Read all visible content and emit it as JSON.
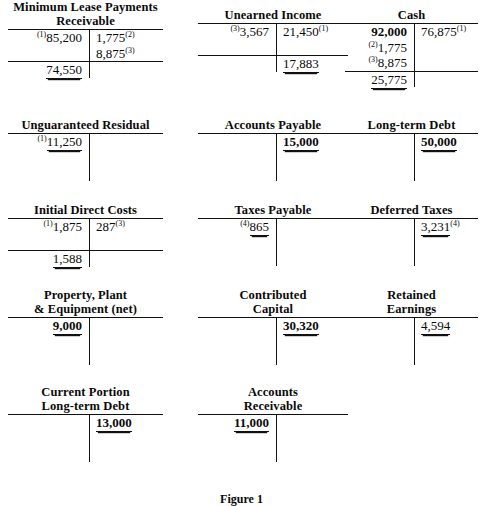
{
  "figure": {
    "caption": "Figure 1"
  },
  "layout": {
    "columns": [
      {
        "left": 8,
        "width": 155
      },
      {
        "left": 198,
        "width": 150
      },
      {
        "left": 345,
        "width": 133
      }
    ],
    "stem_offset": 0.52
  },
  "accounts": [
    {
      "id": "minimum-lease-payments-receivable",
      "name": "Minimum Lease Payments\nReceivable",
      "col": 0,
      "top": 0,
      "title_lines": 2,
      "rows": [
        {
          "debit": {
            "sup_left": "(1)",
            "amount": "85,200"
          },
          "credit": {
            "amount": "1,775",
            "sup_right": "(2)"
          }
        },
        {
          "debit": null,
          "credit": {
            "amount": "8,875",
            "sup_right": "(3)"
          }
        }
      ],
      "footing": true,
      "balance": {
        "side": "debit",
        "amount": "74,550",
        "rule": "double"
      }
    },
    {
      "id": "unearned-income",
      "name": "Unearned Income",
      "col": 1,
      "top": 8,
      "title_lines": 1,
      "rows": [
        {
          "debit": {
            "sup_left": "(3)",
            "amount": "3,567"
          },
          "credit": {
            "amount": "21,450",
            "sup_right": "(1)"
          }
        },
        {
          "debit": null,
          "credit": null
        }
      ],
      "footing": true,
      "balance": {
        "side": "credit",
        "amount": "17,883",
        "rule": "double"
      }
    },
    {
      "id": "cash",
      "name": "Cash",
      "col": 2,
      "top": 8,
      "title_lines": 1,
      "rows": [
        {
          "debit": {
            "amount": "92,000",
            "bold": true
          },
          "credit": {
            "amount": "76,875",
            "sup_right": "(1)"
          }
        },
        {
          "debit": {
            "sup_left": "(2)",
            "amount": "1,775"
          },
          "credit": null
        },
        {
          "debit": {
            "sup_left": "(3)",
            "amount": "8,875"
          },
          "credit": null
        }
      ],
      "footing": true,
      "balance": {
        "side": "debit",
        "amount": "25,775",
        "rule": "double"
      }
    },
    {
      "id": "unguaranteed-residual",
      "name": "Unguaranteed Residual",
      "col": 0,
      "top": 118,
      "title_lines": 1,
      "rows": [
        {
          "debit": {
            "sup_left": "(1)",
            "amount": "11,250",
            "rule": "double"
          },
          "credit": null
        },
        {
          "debit": null,
          "credit": null
        },
        {
          "debit": null,
          "credit": null
        }
      ],
      "footing": false,
      "balance": null
    },
    {
      "id": "accounts-payable",
      "name": "Accounts Payable",
      "col": 1,
      "top": 118,
      "title_lines": 1,
      "rows": [
        {
          "debit": null,
          "credit": {
            "amount": "15,000",
            "bold": true,
            "rule": "double"
          }
        },
        {
          "debit": null,
          "credit": null
        },
        {
          "debit": null,
          "credit": null
        }
      ],
      "footing": false,
      "balance": null
    },
    {
      "id": "long-term-debt",
      "name": "Long-term Debt",
      "col": 2,
      "top": 118,
      "title_lines": 1,
      "rows": [
        {
          "debit": null,
          "credit": {
            "amount": "50,000",
            "bold": true,
            "rule": "double"
          }
        },
        {
          "debit": null,
          "credit": null
        },
        {
          "debit": null,
          "credit": null
        }
      ],
      "footing": false,
      "balance": null
    },
    {
      "id": "initial-direct-costs",
      "name": "Initial Direct Costs",
      "col": 0,
      "top": 203,
      "title_lines": 1,
      "rows": [
        {
          "debit": {
            "sup_left": "(1)",
            "amount": "1,875"
          },
          "credit": {
            "amount": "287",
            "sup_right": "(3)"
          }
        },
        {
          "debit": null,
          "credit": null
        }
      ],
      "footing": true,
      "balance": {
        "side": "debit",
        "amount": "1,588",
        "rule": "double"
      }
    },
    {
      "id": "taxes-payable",
      "name": "Taxes Payable",
      "col": 1,
      "top": 203,
      "title_lines": 1,
      "rows": [
        {
          "debit": {
            "sup_left": "(4)",
            "amount": "865",
            "rule": "double"
          },
          "credit": null
        },
        {
          "debit": null,
          "credit": null
        },
        {
          "debit": null,
          "credit": null
        }
      ],
      "footing": false,
      "balance": null
    },
    {
      "id": "deferred-taxes",
      "name": "Deferred Taxes",
      "col": 2,
      "top": 203,
      "title_lines": 1,
      "rows": [
        {
          "debit": null,
          "credit": {
            "amount": "3,231",
            "sup_right": "(4)",
            "rule": "double"
          }
        },
        {
          "debit": null,
          "credit": null
        },
        {
          "debit": null,
          "credit": null
        }
      ],
      "footing": false,
      "balance": null
    },
    {
      "id": "property-plant-equipment-net",
      "name": "Property, Plant\n& Equipment (net)",
      "col": 0,
      "top": 288,
      "title_lines": 2,
      "rows": [
        {
          "debit": {
            "amount": "9,000",
            "bold": true,
            "rule": "double"
          },
          "credit": null
        },
        {
          "debit": null,
          "credit": null
        },
        {
          "debit": null,
          "credit": null
        }
      ],
      "footing": false,
      "balance": null
    },
    {
      "id": "contributed-capital",
      "name": "Contributed\nCapital",
      "col": 1,
      "top": 288,
      "title_lines": 2,
      "rows": [
        {
          "debit": null,
          "credit": {
            "amount": "30,320",
            "bold": true,
            "rule": "double"
          }
        },
        {
          "debit": null,
          "credit": null
        },
        {
          "debit": null,
          "credit": null
        }
      ],
      "footing": false,
      "balance": null
    },
    {
      "id": "retained-earnings",
      "name": "Retained\nEarnings",
      "col": 2,
      "top": 288,
      "title_lines": 2,
      "rows": [
        {
          "debit": null,
          "credit": {
            "amount": "4,594",
            "rule": "double"
          }
        },
        {
          "debit": null,
          "credit": null
        },
        {
          "debit": null,
          "credit": null
        }
      ],
      "footing": false,
      "balance": null
    },
    {
      "id": "current-portion-long-term-debt",
      "name": "Current Portion\nLong-term Debt",
      "col": 0,
      "top": 385,
      "title_lines": 2,
      "rows": [
        {
          "debit": null,
          "credit": {
            "amount": "13,000",
            "bold": true,
            "rule": "double"
          }
        },
        {
          "debit": null,
          "credit": null
        },
        {
          "debit": null,
          "credit": null
        }
      ],
      "footing": false,
      "balance": null
    },
    {
      "id": "accounts-receivable",
      "name": "Accounts\nReceivable",
      "col": 1,
      "top": 385,
      "title_lines": 2,
      "rows": [
        {
          "debit": {
            "amount": "11,000",
            "bold": true,
            "rule": "double"
          },
          "credit": null
        },
        {
          "debit": null,
          "credit": null
        },
        {
          "debit": null,
          "credit": null
        }
      ],
      "footing": false,
      "balance": null
    }
  ]
}
